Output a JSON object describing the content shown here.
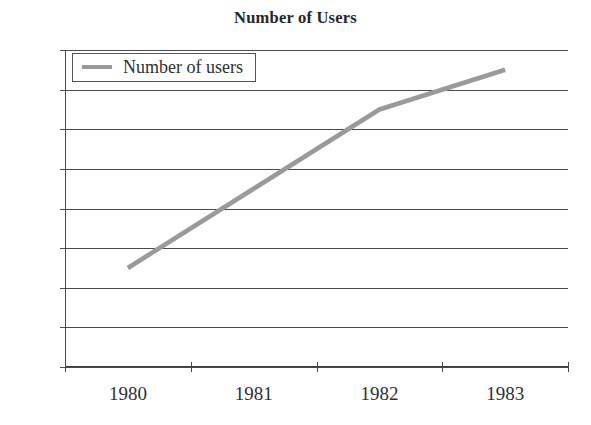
{
  "chart_data": {
    "type": "line",
    "title": "Number of Users",
    "xlabel": "",
    "ylabel": "",
    "categories": [
      "1980",
      "1981",
      "1982",
      "1983"
    ],
    "series": [
      {
        "name": "Number of users",
        "values": [
          25,
          45,
          65,
          75
        ],
        "color": "#9a9a9a"
      }
    ],
    "ylim": [
      0,
      80
    ],
    "yticks": [
      "0",
      "10",
      "20",
      "30",
      "40",
      "50",
      "60",
      "70",
      "80"
    ],
    "grid": true,
    "legend_position": "top-left-inside"
  },
  "legend": {
    "entries": [
      {
        "label": "Number of users",
        "swatch": "line-swatch-icon"
      }
    ]
  }
}
